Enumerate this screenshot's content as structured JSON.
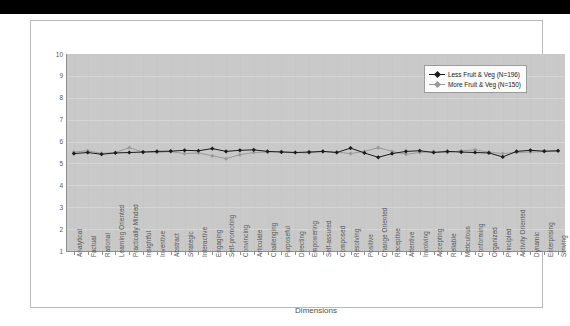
{
  "chart_data": {
    "type": "line",
    "title": "",
    "xlabel": "Dimensions",
    "ylabel": "",
    "ylim": [
      1,
      10
    ],
    "ytick_labels": [
      "10",
      "9",
      "8",
      "7",
      "6",
      "5",
      "4",
      "3",
      "2",
      "1"
    ],
    "grid": true,
    "legend_position": "top-right",
    "plot_background": "#c9c9c9",
    "categories": [
      "Analytical",
      "Factual",
      "Rational",
      "Learning Oriented",
      "Practically Minded",
      "Insightful",
      "Inventive",
      "Abstract",
      "Strategic",
      "Interactive",
      "Engaging",
      "Self-promoting",
      "Convincing",
      "Articulate",
      "Challenging",
      "Purposeful",
      "Directing",
      "Empowering",
      "Self-assured",
      "Composed",
      "Resolving",
      "Positive",
      "Change Oriented",
      "Receptive",
      "Attentive",
      "Involving",
      "Accepting",
      "Reliable",
      "Meticulous",
      "Conforming",
      "Organized",
      "Principled",
      "Activity Oriented",
      "Dynamic",
      "Enterprising",
      "Striving"
    ],
    "series": [
      {
        "name": "Less Fruit & Veg",
        "n": 196,
        "legend_label": "Less Fruit & Veg (N=196)",
        "color": "#1a1a1a",
        "marker": "filled-diamond",
        "values": [
          5.45,
          5.5,
          5.42,
          5.48,
          5.5,
          5.52,
          5.55,
          5.56,
          5.6,
          5.58,
          5.68,
          5.55,
          5.6,
          5.62,
          5.55,
          5.52,
          5.5,
          5.52,
          5.55,
          5.5,
          5.7,
          5.48,
          5.28,
          5.45,
          5.55,
          5.58,
          5.5,
          5.55,
          5.52,
          5.5,
          5.48,
          5.3,
          5.55,
          5.6,
          5.56,
          5.58
        ]
      },
      {
        "name": "More Fruit & Veg",
        "n": 150,
        "legend_label": "More Fruit & Veg (N=150)",
        "color": "#9a9a9a",
        "marker": "filled-diamond",
        "values": [
          5.52,
          5.58,
          5.46,
          5.5,
          5.72,
          5.52,
          5.5,
          5.54,
          5.45,
          5.48,
          5.35,
          5.22,
          5.4,
          5.5,
          5.52,
          5.55,
          5.5,
          5.48,
          5.55,
          5.52,
          5.45,
          5.55,
          5.72,
          5.55,
          5.42,
          5.5,
          5.54,
          5.5,
          5.58,
          5.62,
          5.52,
          5.45,
          5.5,
          5.52,
          5.54,
          5.56
        ]
      }
    ]
  }
}
